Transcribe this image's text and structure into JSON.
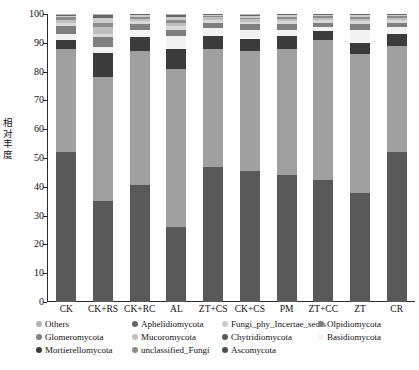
{
  "chart_data": {
    "type": "bar",
    "title": "",
    "xlabel": "",
    "ylabel": "相对丰度",
    "ylim": [
      0,
      100
    ],
    "ytick_labels": [
      "0",
      "10",
      "20",
      "30",
      "40",
      "50",
      "60",
      "70",
      "80",
      "90",
      "100"
    ],
    "ytick_values": [
      0,
      10,
      20,
      30,
      40,
      50,
      60,
      70,
      80,
      90,
      100
    ],
    "grid": false,
    "legend_position": "bottom",
    "stacked": true,
    "categories": [
      "CK",
      "CK+RS",
      "CK+RC",
      "AL",
      "ZT+CS",
      "CK+CS",
      "PM",
      "ZT+CC",
      "ZT",
      "CR"
    ],
    "series": [
      {
        "name": "Ascomycota",
        "color": "#595959",
        "values": [
          52.0,
          35.0,
          40.5,
          26.0,
          47.0,
          45.5,
          44.0,
          42.5,
          38.0,
          52.0
        ]
      },
      {
        "name": "Basidiomycota",
        "color": "#a0a0a0",
        "values": [
          36.0,
          43.0,
          46.5,
          55.0,
          41.0,
          41.5,
          44.0,
          48.5,
          48.0,
          37.0
        ]
      },
      {
        "name": "Mortierellomycota",
        "color": "#3b3b3b",
        "values": [
          3.0,
          8.5,
          5.0,
          7.0,
          4.5,
          4.5,
          4.5,
          3.0,
          4.0,
          4.0
        ]
      },
      {
        "name": "Chytridiomycota",
        "color": "#f2f2f2",
        "values": [
          2.0,
          2.0,
          2.5,
          4.5,
          2.5,
          3.0,
          2.0,
          1.5,
          4.5,
          2.5
        ]
      },
      {
        "name": "Glomeromycota",
        "color": "#7f7f7f",
        "values": [
          3.0,
          3.5,
          2.0,
          2.0,
          2.0,
          2.0,
          2.0,
          1.5,
          2.0,
          1.5
        ]
      },
      {
        "name": "unclassified_Fungi",
        "color": "#d9d9d9",
        "values": [
          1.0,
          1.0,
          1.0,
          1.5,
          1.0,
          0.8,
          1.0,
          0.8,
          1.0,
          0.8
        ]
      },
      {
        "name": "Mucoromycota",
        "color": "#bfbfbf",
        "values": [
          1.0,
          2.5,
          0.8,
          1.0,
          0.8,
          0.8,
          0.8,
          0.8,
          0.8,
          0.8
        ]
      },
      {
        "name": "Olpidiomycota",
        "color": "#8c8c8c",
        "values": [
          0.8,
          1.5,
          0.8,
          1.0,
          0.6,
          0.6,
          0.6,
          0.6,
          0.6,
          0.6
        ]
      },
      {
        "name": "Fungi_phy_Incertae_sedis",
        "color": "#cccccc",
        "values": [
          0.6,
          1.5,
          0.6,
          0.8,
          0.4,
          0.5,
          0.6,
          0.5,
          0.6,
          0.4
        ]
      },
      {
        "name": "Aphelidiomycota",
        "color": "#666666",
        "values": [
          0.4,
          1.0,
          0.3,
          0.7,
          0.2,
          0.3,
          0.5,
          0.3,
          0.5,
          0.4
        ]
      },
      {
        "name": "Others",
        "color": "#b3b3b3",
        "values": [
          0.2,
          0.5,
          0.0,
          0.5,
          0.0,
          0.5,
          0.0,
          0.0,
          0.0,
          0.0
        ]
      }
    ]
  },
  "axis": {
    "y_title": "相对丰度",
    "y_title_chars": [
      "相",
      "对",
      "丰",
      "度"
    ]
  },
  "legend": {
    "items": [
      {
        "label": "Others",
        "color": "#b3b3b3",
        "col": 0,
        "row": 0
      },
      {
        "label": "Glomeromycota",
        "color": "#7f7f7f",
        "col": 0,
        "row": 1
      },
      {
        "label": "Mortierellomycota",
        "color": "#3b3b3b",
        "col": 0,
        "row": 2
      },
      {
        "label": "Aphelidiomycota",
        "color": "#666666",
        "col": 1,
        "row": 0
      },
      {
        "label": "Mucoromycota",
        "color": "#bfbfbf",
        "col": 1,
        "row": 1
      },
      {
        "label": "unclassified_Fungi",
        "color": "#8c8c8c",
        "col": 1,
        "row": 2
      },
      {
        "label": "Fungi_phy_Incertae_sedis",
        "color": "#cccccc",
        "col": 2,
        "row": 0
      },
      {
        "label": "Chytridiomycota",
        "color": "#595959",
        "col": 2,
        "row": 1
      },
      {
        "label": "Ascomycota",
        "color": "#4d4d4d",
        "col": 2,
        "row": 2
      },
      {
        "label": "Olpidiomycota",
        "color": "#808080",
        "col": 3,
        "row": 0
      },
      {
        "label": "Basidiomycota",
        "color": "#f2f2f2",
        "col": 3,
        "row": 1
      }
    ]
  }
}
